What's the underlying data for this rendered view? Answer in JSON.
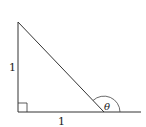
{
  "diagram": {
    "type": "right-triangle",
    "labels": {
      "vertical_side": "1",
      "horizontal_side": "1",
      "angle": "θ"
    },
    "colors": {
      "stroke": "#333333",
      "background": "#ffffff"
    },
    "vertices": {
      "top": [
        18,
        22
      ],
      "right_angle": [
        18,
        112
      ],
      "base_right": [
        104,
        112
      ]
    },
    "base_extension_end": [
      141,
      112
    ],
    "right_angle_marker": true,
    "angle_arc": "exterior angle at base-right vertex between extended base and hypotenuse"
  }
}
